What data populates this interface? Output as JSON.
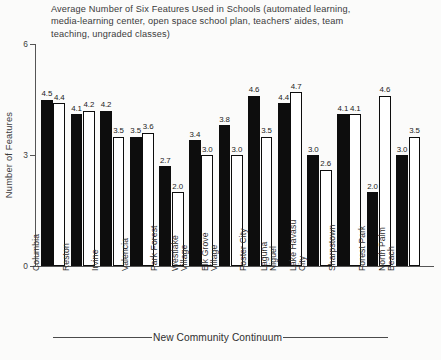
{
  "chart_data": {
    "type": "bar",
    "title": "Average Number of Six Features Used in Schools (automated learning,\nmedia-learning center, open space school plan, teachers' aides, team\nteaching, ungraded classes)",
    "xlabel": "New Community Continuum",
    "ylabel": "Number of Features",
    "ylim": [
      0,
      6
    ],
    "yticks": [
      "0",
      "3",
      "6"
    ],
    "ytick_values": [
      0,
      3,
      6
    ],
    "grid": false,
    "legend_position": "none",
    "categories": [
      "Columbia",
      "Reston",
      "Irvine",
      "Valencia",
      "Park Forest",
      "Westlake\nVillage",
      "Elk Grove\nVillage",
      "Foster City",
      "Laguna\nNiguel",
      "Lake Havasu\nCity",
      "Sharpstown",
      "Forest Park",
      "North Palm\nBeach"
    ],
    "series": [
      {
        "name": "new-community",
        "style": "filled",
        "values": [
          4.5,
          4.1,
          4.2,
          3.5,
          2.7,
          3.4,
          3.8,
          4.6,
          4.4,
          3.0,
          4.1,
          2.0,
          3.0
        ],
        "labels": [
          "4.5",
          "4.1",
          "4.2",
          "3.5",
          "2.7",
          "3.4",
          "3.8",
          "4.6",
          "4.4",
          "3.0",
          "4.1",
          "2.0",
          "3.0"
        ]
      },
      {
        "name": "comparison-community",
        "style": "open",
        "values": [
          4.4,
          4.2,
          3.5,
          3.6,
          2.0,
          3.0,
          3.0,
          3.5,
          4.7,
          2.6,
          4.1,
          4.6,
          3.5
        ],
        "labels": [
          "4.4",
          "4.2",
          "3.5",
          "3.6",
          "2.0",
          "3.0",
          "3.0",
          "3.5",
          "4.7",
          "2.6",
          "4.1",
          "4.6",
          "3.5"
        ]
      }
    ]
  },
  "colors": {
    "background": "#fbfbfa",
    "filled_bar": "#0d0d0d",
    "open_bar": "#ffffff",
    "axis": "#555555",
    "text": "#2b2b2b"
  }
}
